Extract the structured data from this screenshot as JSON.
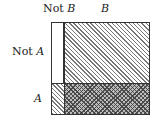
{
  "diagram": {
    "type": "contingency-region-diagram",
    "column_labels": {
      "not_b": {
        "prefix": "Not ",
        "var": "B"
      },
      "b": {
        "var": "B"
      }
    },
    "row_labels": {
      "not_a": {
        "prefix": "Not ",
        "var": "A"
      },
      "a": {
        "var": "A"
      }
    },
    "cells": [
      {
        "row": "Not A",
        "col": "Not B",
        "fill": "blank"
      },
      {
        "row": "Not A",
        "col": "B",
        "fill": "diagonal-hatch"
      },
      {
        "row": "A",
        "col": "Not B",
        "fill": "diagonal-hatch"
      },
      {
        "row": "A",
        "col": "B",
        "fill": "cross-hatch"
      }
    ],
    "colors": {
      "border": "#333333",
      "hatch": "#777777",
      "cross_hatch": "#3c3c3c",
      "background": "#ffffff"
    }
  }
}
